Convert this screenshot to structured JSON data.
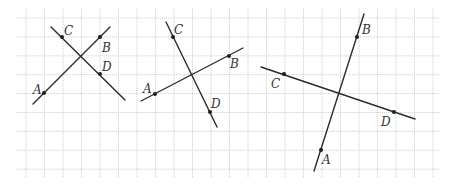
{
  "grid": {
    "x0": 26,
    "dx": 18.5,
    "cols": 23,
    "y0": 18,
    "dy": 18.9,
    "rows": 9,
    "left": 16,
    "right": 440,
    "top": 8,
    "bottom": 178,
    "color": "#c9c9c9"
  },
  "figures": [
    {
      "id": "figure-1",
      "lines": [
        {
          "name": "AB",
          "x1": 33,
          "y1": 104,
          "x2": 110,
          "y2": 27
        },
        {
          "name": "CD",
          "x1": 51,
          "y1": 27,
          "x2": 125,
          "y2": 100
        }
      ],
      "points": [
        {
          "name": "A",
          "x": 44,
          "y": 93,
          "lx": 33,
          "ly": 94
        },
        {
          "name": "B",
          "x": 100,
          "y": 37,
          "lx": 102,
          "ly": 52
        },
        {
          "name": "C",
          "x": 62,
          "y": 37,
          "lx": 64,
          "ly": 35
        },
        {
          "name": "D",
          "x": 100,
          "y": 74,
          "lx": 102,
          "ly": 71
        }
      ]
    },
    {
      "id": "figure-2",
      "lines": [
        {
          "name": "AB",
          "x1": 141,
          "y1": 101,
          "x2": 243,
          "y2": 48
        },
        {
          "name": "CD",
          "x1": 166,
          "y1": 22,
          "x2": 217,
          "y2": 127
        }
      ],
      "points": [
        {
          "name": "A",
          "x": 155,
          "y": 94,
          "lx": 143,
          "ly": 93
        },
        {
          "name": "B",
          "x": 229,
          "y": 56,
          "lx": 230,
          "ly": 68
        },
        {
          "name": "C",
          "x": 173,
          "y": 37,
          "lx": 174,
          "ly": 34
        },
        {
          "name": "D",
          "x": 210,
          "y": 112,
          "lx": 211,
          "ly": 108
        }
      ]
    },
    {
      "id": "figure-3",
      "lines": [
        {
          "name": "AB",
          "x1": 314,
          "y1": 171,
          "x2": 364,
          "y2": 14
        },
        {
          "name": "CD",
          "x1": 261,
          "y1": 67,
          "x2": 415,
          "y2": 119
        }
      ],
      "points": [
        {
          "name": "A",
          "x": 321,
          "y": 150,
          "lx": 322,
          "ly": 164
        },
        {
          "name": "B",
          "x": 357,
          "y": 37,
          "lx": 362,
          "ly": 34
        },
        {
          "name": "C",
          "x": 284,
          "y": 74,
          "lx": 271,
          "ly": 88
        },
        {
          "name": "D",
          "x": 394,
          "y": 112,
          "lx": 381,
          "ly": 126
        }
      ]
    }
  ]
}
